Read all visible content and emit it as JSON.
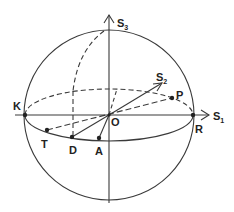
{
  "diagram": {
    "colors": {
      "stroke": "#3a3a3a",
      "background": "#ffffff"
    },
    "axes": {
      "s1": {
        "base": "S",
        "sub": "1"
      },
      "s2": {
        "base": "S",
        "sub": "2"
      },
      "s3": {
        "base": "S",
        "sub": "3"
      }
    },
    "points": {
      "origin": "O",
      "k": "K",
      "r": "R",
      "p": "P",
      "t": "T",
      "d": "D",
      "a": "A"
    }
  }
}
